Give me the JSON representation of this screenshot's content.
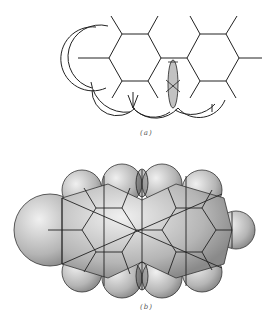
{
  "figures": [
    {
      "id": "a",
      "caption": "(a)",
      "description": "Skeletal hexagonal ring structure with atomic radius arcs; hatched overlap region between rings"
    },
    {
      "id": "b",
      "caption": "(b)",
      "description": "Space-filling model with stippled spheres; hatched overlap regions top and bottom center"
    }
  ],
  "colors": {
    "line": "#222222",
    "stipple": "#333333",
    "background": "#ffffff"
  }
}
